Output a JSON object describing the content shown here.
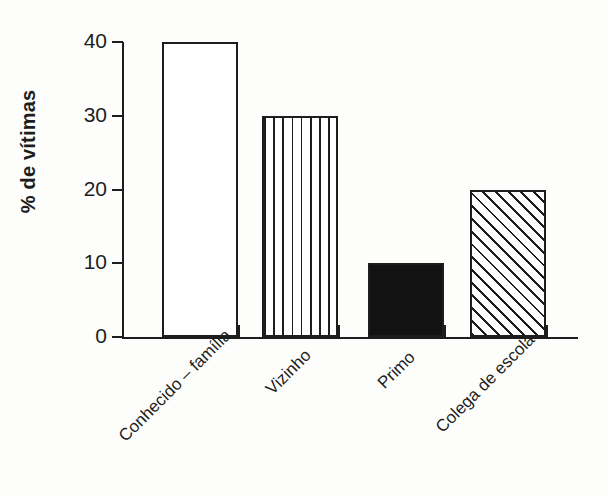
{
  "chart_data": {
    "type": "bar",
    "title": "",
    "subtitle": "",
    "xlabel": "",
    "ylabel": "% de vítimas",
    "categories": [
      "Conhecido – família",
      "Vizinho",
      "Primo",
      "Colega de escola"
    ],
    "values": [
      40,
      30,
      10,
      20
    ],
    "series": [
      {
        "name": "% de vítimas",
        "values": [
          40,
          30,
          10,
          20
        ]
      }
    ],
    "bar_fills": [
      "empty",
      "vertical-hatch",
      "solid-black",
      "diagonal-hatch"
    ],
    "ylim": [
      0,
      40
    ],
    "yticks": [
      0,
      10,
      20,
      30,
      40
    ],
    "ytick_labels": [
      "0",
      "10",
      "20",
      "30",
      "40"
    ],
    "grid": false,
    "legend": false,
    "legend_position": "none",
    "annotations": [],
    "colors": {
      "ink": "#1d1d1d",
      "background": "#fdfdfc",
      "bar_outline": "#1d1d1d",
      "bar_solid": "#121212"
    },
    "xtick_label_rotation": -45
  }
}
